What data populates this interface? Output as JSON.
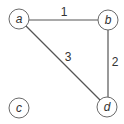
{
  "graph": {
    "nodes": [
      {
        "id": "a",
        "label": "a",
        "x": 19,
        "y": 19
      },
      {
        "id": "b",
        "label": "b",
        "x": 108,
        "y": 20
      },
      {
        "id": "c",
        "label": "c",
        "x": 19,
        "y": 108
      },
      {
        "id": "d",
        "label": "d",
        "x": 107,
        "y": 107
      }
    ],
    "edges": [
      {
        "from": "a",
        "to": "b",
        "weight": "1",
        "label_x": 64,
        "label_y": 16
      },
      {
        "from": "b",
        "to": "d",
        "weight": "2",
        "label_x": 115,
        "label_y": 66
      },
      {
        "from": "a",
        "to": "d",
        "weight": "3",
        "label_x": 68,
        "label_y": 61
      }
    ],
    "node_radius": 10,
    "colors": {
      "node_stroke": "#6a6a6a",
      "edge": "#555555",
      "text": "#333333"
    }
  }
}
